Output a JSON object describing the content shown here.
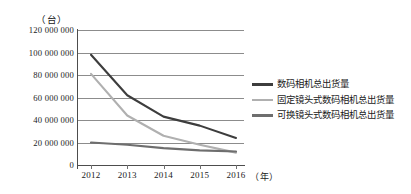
{
  "chart_data": {
    "type": "line",
    "title": "",
    "subtitle": "",
    "xlabel": "（年）",
    "ylabel": "（台）",
    "x": [
      "2012",
      "2013",
      "2014",
      "2015",
      "2016"
    ],
    "categories": [
      "2012",
      "2013",
      "2014",
      "2015",
      "2016"
    ],
    "ylim": [
      0,
      120000000
    ],
    "ytick_values": [
      0,
      20000000,
      40000000,
      60000000,
      80000000,
      100000000,
      120000000
    ],
    "ytick_labels": [
      "0",
      "20 000 000",
      "40 000 000",
      "60 000 000",
      "80 000 000",
      "100 000 000",
      "120 000 000"
    ],
    "grid": true,
    "grid_axis": "y",
    "legend_position": "right",
    "series": [
      {
        "name": "数码相机总出货量",
        "color": "#3d3d3d",
        "values": [
          98000000,
          62000000,
          43000000,
          35000000,
          24000000
        ]
      },
      {
        "name": "固定镜头式数码相机总出货量",
        "color": "#b0b0b0",
        "values": [
          81000000,
          44000000,
          26000000,
          18000000,
          11000000
        ]
      },
      {
        "name": "可换镜头式数码相机总出货量",
        "color": "#6e6e6e",
        "values": [
          20000000,
          18000000,
          15000000,
          13000000,
          12000000
        ]
      }
    ]
  },
  "axes": {
    "y_unit_caption": "（台）",
    "x_unit_caption": "（年）"
  },
  "legend": {
    "entries": [
      {
        "label": "数码相机总出货量",
        "color": "#3d3d3d"
      },
      {
        "label": "固定镜头式数码相机总出货量",
        "color": "#b0b0b0"
      },
      {
        "label": "可换镜头式数码相机总出货量",
        "color": "#6e6e6e"
      }
    ]
  },
  "colors": {
    "axis": "#4d4d4d",
    "grid": "#8c8c8c",
    "text": "#1a1a1a",
    "background": "#ffffff"
  }
}
